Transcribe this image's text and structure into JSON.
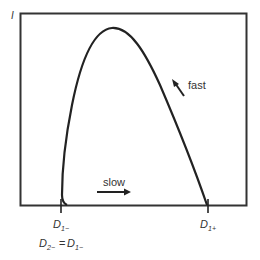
{
  "diagram": {
    "type": "phase-curve",
    "y_axis_label": "I",
    "curve": {
      "description": "hump-shaped closed trajectory starting at D1- rising steeply to a peak then descending to D1+",
      "points": [
        [
          67,
          205
        ],
        [
          62,
          198
        ],
        [
          62,
          180
        ],
        [
          65,
          150
        ],
        [
          70,
          115
        ],
        [
          77,
          80
        ],
        [
          85,
          55
        ],
        [
          95,
          37
        ],
        [
          112,
          28
        ],
        [
          128,
          34
        ],
        [
          143,
          50
        ],
        [
          158,
          80
        ],
        [
          175,
          120
        ],
        [
          190,
          160
        ],
        [
          207,
          205
        ]
      ],
      "color": "#222222"
    },
    "annotations": {
      "fast": "fast",
      "slow": "slow"
    },
    "ticks": {
      "left": {
        "main": "D",
        "sub": "1−"
      },
      "right": {
        "main": "D",
        "sub": "1+"
      }
    },
    "equation": {
      "lhs_main": "D",
      "lhs_sub": "2−",
      "equals": "=",
      "rhs_main": "D",
      "rhs_sub": "1−"
    },
    "colors": {
      "frame": "#333333",
      "curve": "#222222",
      "text": "#333333"
    }
  }
}
